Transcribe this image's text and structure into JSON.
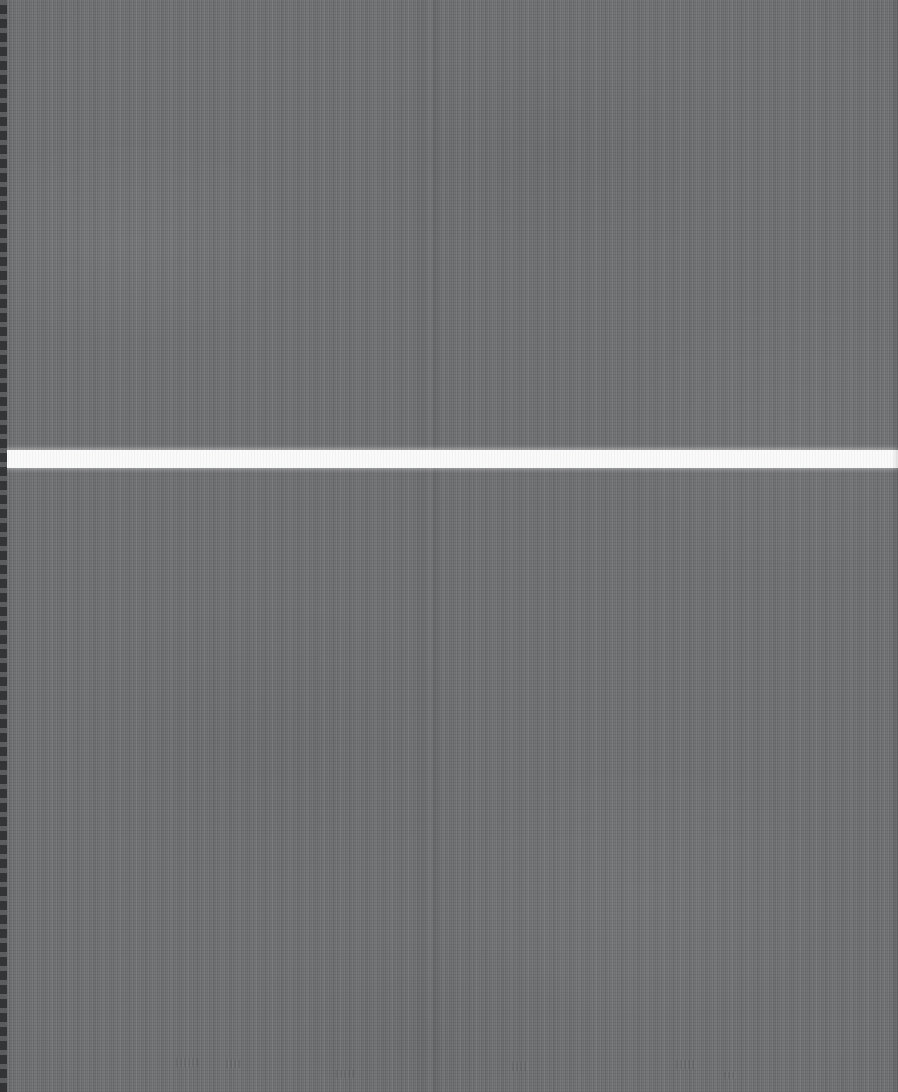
{
  "screen": {
    "width": 898,
    "height": 1092,
    "state_label": "",
    "description": "Corrupted / illegible screen capture: a uniform mid-gray field covered in fine vertical stripe noise, split by a single bright horizontal divider band. No text, icons, controls or chart content are legible anywhere in the image.",
    "legible_text_present": false
  },
  "colors": {
    "background_gray": "#6f7072",
    "divider_white": "#fafafa",
    "left_edge_dark": "#4a4b4d",
    "noise_light": "#8a8b8d",
    "noise_dark": "#58595b"
  },
  "divider": {
    "name": "horizontal-divider-band",
    "top": 450,
    "height": 18,
    "color": "#fafafa",
    "label": ""
  },
  "panels": [
    {
      "name": "upper-panel",
      "top": 0,
      "height": 450,
      "label": "",
      "content": ""
    },
    {
      "name": "lower-panel",
      "top": 468,
      "height": 624,
      "label": "",
      "content": ""
    }
  ],
  "edges": {
    "left_column_label": "",
    "right_column_label": ""
  },
  "artifacts": [
    {
      "name": "vertical-seam",
      "x": 430,
      "label": ""
    },
    {
      "name": "ghost-smudge-1",
      "x": 176,
      "y": 1058,
      "width": 22,
      "height": 9,
      "label": ""
    },
    {
      "name": "ghost-smudge-2",
      "x": 226,
      "y": 1060,
      "width": 14,
      "height": 8,
      "label": ""
    },
    {
      "name": "ghost-smudge-3",
      "x": 336,
      "y": 1070,
      "width": 18,
      "height": 8,
      "label": ""
    },
    {
      "name": "ghost-smudge-4",
      "x": 512,
      "y": 1062,
      "width": 16,
      "height": 9,
      "label": ""
    },
    {
      "name": "ghost-smudge-5",
      "x": 676,
      "y": 1060,
      "width": 20,
      "height": 9,
      "label": ""
    },
    {
      "name": "ghost-smudge-6",
      "x": 724,
      "y": 1072,
      "width": 12,
      "height": 7,
      "label": ""
    }
  ]
}
